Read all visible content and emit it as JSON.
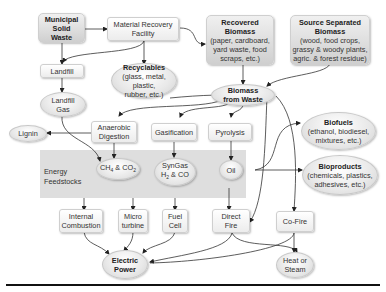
{
  "diagram": {
    "type": "flowchart",
    "band_label": [
      "Energy",
      "Feedstocks"
    ],
    "nodes": {
      "msw": {
        "lines": [
          "Municipal",
          "Solid",
          "Waste"
        ]
      },
      "mrf": {
        "lines": [
          "Material Recovery",
          "Facility"
        ]
      },
      "recovered": {
        "title": "Recovered",
        "title2": "Biomass",
        "lines": [
          "(paper, cardboard,",
          "yard waste, food",
          "scraps, etc.)"
        ]
      },
      "source": {
        "title": "Source Separated",
        "title2": "Biomass",
        "lines": [
          "(wood, food crops,",
          "grassy & woody plants,",
          "agric. & forest residue)"
        ]
      },
      "landfill": {
        "lines": [
          "Landfill"
        ]
      },
      "recyclables": {
        "title": "Recyclables",
        "lines": [
          "(glass, metal, plastic,",
          "rubber, etc.)"
        ]
      },
      "landfill_gas": {
        "lines": [
          "Landfill",
          "Gas"
        ]
      },
      "bfw": {
        "lines": [
          "Biomass",
          "from Waste"
        ]
      },
      "lignin": {
        "lines": [
          "Lignin"
        ]
      },
      "anaerobic": {
        "lines": [
          "Anaerobic",
          "Digestion"
        ]
      },
      "gasification": {
        "lines": [
          "Gasification"
        ]
      },
      "pyrolysis": {
        "lines": [
          "Pyrolysis"
        ]
      },
      "biofuels": {
        "title": "Biofuels",
        "lines": [
          "(ethanol, biodiesel,",
          "mixtures, etc.)"
        ]
      },
      "ch4": {
        "lines": [
          "CH4 & CO2"
        ]
      },
      "syngas": {
        "lines": [
          "SynGas",
          "H2 & CO"
        ]
      },
      "oil": {
        "lines": [
          "Oil"
        ]
      },
      "bioproducts": {
        "title": "Bioproducts",
        "lines": [
          "(chemicals, plastics,",
          "adhesives, etc.)"
        ]
      },
      "ice": {
        "lines": [
          "Internal",
          "Combustion"
        ]
      },
      "micro": {
        "lines": [
          "Micro",
          "turbine"
        ]
      },
      "fuelcell": {
        "lines": [
          "Fuel",
          "Cell"
        ]
      },
      "direct": {
        "lines": [
          "Direct",
          "Fire"
        ]
      },
      "cofire": {
        "lines": [
          "Co-Fire"
        ]
      },
      "electric": {
        "lines": [
          "Electric",
          "Power"
        ]
      },
      "heat": {
        "lines": [
          "Heat or",
          "Steam"
        ]
      }
    },
    "edges": [
      [
        "Municipal Solid Waste",
        "Material Recovery Facility"
      ],
      [
        "Municipal Solid Waste",
        "Landfill"
      ],
      [
        "Material Recovery Facility",
        "Landfill"
      ],
      [
        "Material Recovery Facility",
        "Recyclables"
      ],
      [
        "Material Recovery Facility",
        "Recovered Biomass"
      ],
      [
        "Recovered Biomass",
        "Biomass from Waste"
      ],
      [
        "Source Separated Biomass",
        "Biomass from Waste"
      ],
      [
        "Landfill",
        "Landfill Gas"
      ],
      [
        "Landfill Gas",
        "CH4 & CO2"
      ],
      [
        "Biomass from Waste",
        "Anaerobic Digestion"
      ],
      [
        "Biomass from Waste",
        "Gasification"
      ],
      [
        "Biomass from Waste",
        "Pyrolysis"
      ],
      [
        "Biomass from Waste",
        "Direct Fire"
      ],
      [
        "Biomass from Waste",
        "Co-Fire"
      ],
      [
        "Anaerobic Digestion",
        "Lignin"
      ],
      [
        "Anaerobic Digestion",
        "CH4 & CO2"
      ],
      [
        "Gasification",
        "SynGas H2 & CO"
      ],
      [
        "Pyrolysis",
        "Oil"
      ],
      [
        "Oil",
        "Biofuels"
      ],
      [
        "Oil",
        "Bioproducts"
      ],
      [
        "Oil",
        "Direct Fire"
      ],
      [
        "Energy Feedstocks",
        "Internal Combustion"
      ],
      [
        "Energy Feedstocks",
        "Micro turbine"
      ],
      [
        "Energy Feedstocks",
        "Fuel Cell"
      ],
      [
        "Internal Combustion",
        "Electric Power"
      ],
      [
        "Micro turbine",
        "Electric Power"
      ],
      [
        "Fuel Cell",
        "Electric Power"
      ],
      [
        "Direct Fire",
        "Electric Power"
      ],
      [
        "Direct Fire",
        "Heat or Steam"
      ],
      [
        "Co-Fire",
        "Electric Power"
      ],
      [
        "Co-Fire",
        "Heat or Steam"
      ]
    ]
  }
}
